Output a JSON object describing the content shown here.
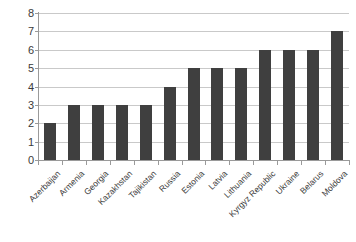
{
  "chart_data": {
    "type": "bar",
    "title": "",
    "subtitle": "",
    "xlabel": "",
    "ylabel": "",
    "ylim": [
      0,
      8
    ],
    "yticks": [
      0,
      1,
      2,
      3,
      4,
      5,
      6,
      7,
      8
    ],
    "grid": true,
    "legend": false,
    "legend_position": "none",
    "bar_color": "#3f3f3f",
    "gridline_color": "#c9c9c9",
    "axis_color": "#9a9a9a",
    "background_color": "#ffffff",
    "categories": [
      "Azerbaijan",
      "Armenia",
      "Georgia",
      "Kazakhstan",
      "Tajikistan",
      "Russia",
      "Estonia",
      "Latvia",
      "Lithuania",
      "Kyrgyz Republic",
      "Ukraine",
      "Belarus",
      "Moldova"
    ],
    "values": [
      2,
      3,
      3,
      3,
      3,
      4,
      5,
      5,
      5,
      6,
      6,
      6,
      7
    ]
  }
}
